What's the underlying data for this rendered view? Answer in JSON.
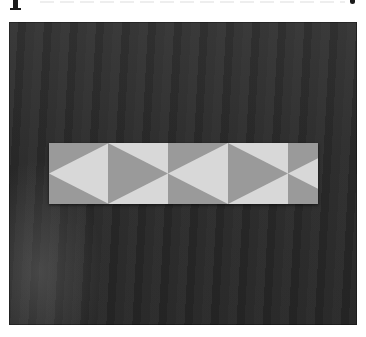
{
  "image": {
    "description": "Photograph of a pieced quilt strip with alternating half-square triangle blocks laid on a dark fabric background",
    "colors": {
      "background_dark": "#2a2a2a",
      "triangle_gray": "#9a9a9a",
      "triangle_light": "#d8d8d8",
      "page": "#ffffff"
    },
    "strip": {
      "blocks": [
        {
          "base": "gray",
          "triangle": "light",
          "points": "left",
          "width": 59
        },
        {
          "base": "light",
          "triangle": "gray",
          "points": "right",
          "width": 60
        },
        {
          "base": "gray",
          "triangle": "light",
          "points": "left",
          "width": 60
        },
        {
          "base": "light",
          "triangle": "gray",
          "points": "right",
          "width": 60
        },
        {
          "base": "gray",
          "triangle": "light",
          "points": "left",
          "width": 30,
          "partial": true
        }
      ]
    }
  }
}
